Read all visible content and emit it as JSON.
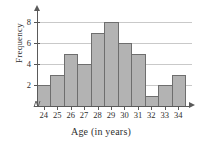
{
  "chart_data": {
    "type": "bar",
    "title": "",
    "xlabel": "Age (in years)",
    "ylabel": "Frequency",
    "categories": [
      "24",
      "25",
      "26",
      "27",
      "28",
      "29",
      "30",
      "31",
      "32",
      "33",
      "34"
    ],
    "values": [
      2,
      3,
      5,
      4,
      7,
      8,
      6,
      5,
      1,
      2,
      3
    ],
    "ylim": [
      0,
      9
    ],
    "yticks": [
      2,
      4,
      6,
      8
    ],
    "ytick_labels": [
      "2",
      "4",
      "6",
      "8"
    ],
    "grid": true,
    "grid_axis": "y",
    "legend": false,
    "bar_fill_color": "#b3b3b3",
    "bar_edge_color": "#6e6e6e",
    "gridline_color": "#c9c9c9",
    "axis_color": "#5a5a5a",
    "text_color": "#2e2e2e",
    "background_color": "#ffffff",
    "axis_break_at_origin": true,
    "arrow_axes": true
  }
}
